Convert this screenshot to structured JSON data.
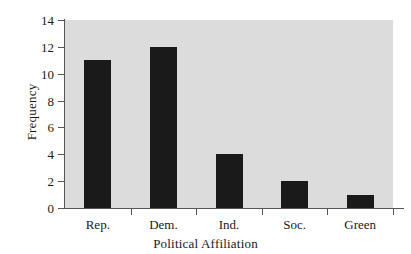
{
  "chart_data": {
    "type": "bar",
    "title": "",
    "subtitle": "",
    "xlabel": "Political Affiliation",
    "ylabel": "Frequency",
    "categories": [
      "Rep.",
      "Dem.",
      "Ind.",
      "Soc.",
      "Green"
    ],
    "values": [
      11,
      12,
      4,
      2,
      1
    ],
    "ylim": [
      0,
      14
    ],
    "ytick_labels": [
      "0",
      "2",
      "4",
      "6",
      "8",
      "10",
      "12",
      "14"
    ],
    "ytick_values": [
      0,
      2,
      4,
      6,
      8,
      10,
      12,
      14
    ],
    "grid": false,
    "legend": null,
    "legend_position": "none",
    "colors": {
      "bar": "#1a1a1a",
      "plot_background": "#dcdcdc",
      "page_background": "#ffffff",
      "axis": "#555555",
      "text": "#1a1a1a"
    }
  }
}
